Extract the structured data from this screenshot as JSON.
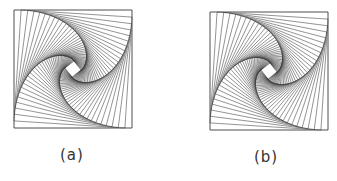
{
  "figure": {
    "panels": [
      {
        "id": "a",
        "caption": "(a)",
        "box": {
          "x": 14,
          "y": 10,
          "size": 118
        },
        "caption_pos": {
          "x": 60,
          "y": 146
        },
        "pattern": {
          "type": "nested-rotated-squares",
          "steps": 40,
          "ratio": 0.06,
          "direction": "counterclockwise"
        }
      },
      {
        "id": "b",
        "caption": "(b)",
        "box": {
          "x": 210,
          "y": 12,
          "size": 118
        },
        "caption_pos": {
          "x": 254,
          "y": 148
        },
        "pattern": {
          "type": "nested-rotated-squares",
          "steps": 40,
          "ratio": 0.06,
          "direction": "counterclockwise"
        }
      }
    ],
    "colors": {
      "line": "#3a3a3a",
      "background": "#ffffff",
      "caption": "#333333"
    }
  }
}
